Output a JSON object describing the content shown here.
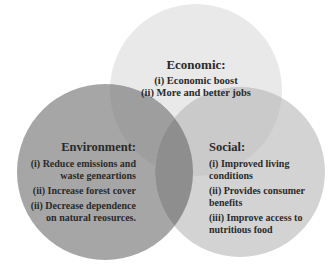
{
  "diagram": {
    "type": "venn",
    "colors": {
      "economic": "#e9e9e9",
      "environment": "#a6a6a6",
      "social": "#d3d3d3",
      "overlap": "#8e8e8e"
    },
    "economic": {
      "title": "Economic:",
      "items": [
        "(i) Economic boost",
        "(ii) More and better jobs"
      ]
    },
    "environment": {
      "title": "Environment:",
      "items": [
        "(i) Reduce emissions and waste geneartions",
        "(ii) Increase forest cover",
        "(ii) Decrease dependence on natural reosurces."
      ]
    },
    "social": {
      "title": "Social:",
      "items": [
        "(i) Improved living conditions",
        "(ii) Provides consumer benefits",
        "(iii) Improve access to nutritious food"
      ]
    }
  }
}
